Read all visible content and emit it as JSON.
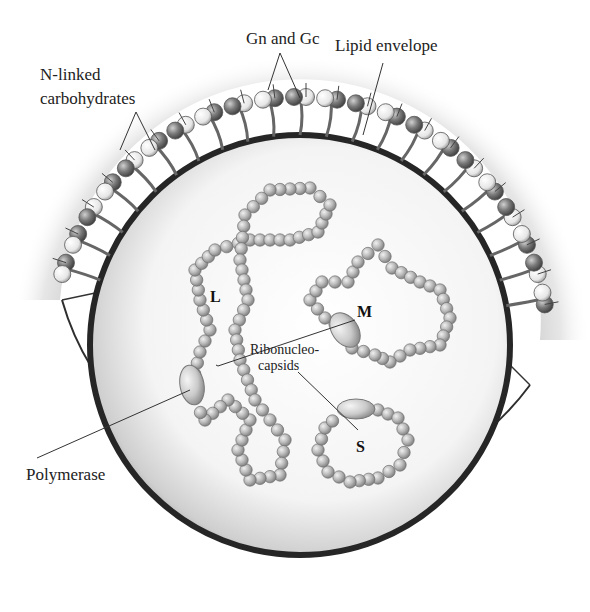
{
  "figure": {
    "labels": {
      "gn_gc": "Gn and Gc",
      "lipid_envelope": "Lipid envelope",
      "n_linked_line1": "N-linked",
      "n_linked_line2": "carbohydrates",
      "ribonucleocapsids_line1": "Ribonucleo-",
      "ribonucleocapsids_line2": "capsids",
      "polymerase": "Polymerase",
      "segment_l": "L",
      "segment_m": "M",
      "segment_s": "S"
    },
    "colors": {
      "membrane": "#2a2a2a",
      "bead_fill": "#b8b8b8",
      "bead_stroke": "#6e6e6e",
      "glycoprotein_dark": "#7a7a7a",
      "glycoprotein_light": "#e8e8e8",
      "shadow": "#9a9a9a",
      "text": "#222222"
    }
  }
}
